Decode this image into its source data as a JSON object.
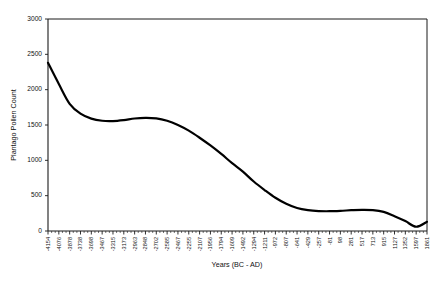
{
  "chart_data": {
    "type": "line",
    "title": "",
    "xlabel": "Years (BC - AD)",
    "ylabel": "Plantago Pollen Count",
    "ylim": [
      0,
      3000
    ],
    "ytick_labels": [
      "0",
      "500",
      "1000",
      "1500",
      "2000",
      "2500",
      "3000"
    ],
    "ytick_values": [
      0,
      500,
      1000,
      1500,
      2000,
      2500,
      3000
    ],
    "grid": false,
    "legend": "none",
    "categories": [
      "-4154",
      "-4076",
      "-3878",
      "-3738",
      "-3698",
      "-3467",
      "-3315",
      "-3173",
      "-2963",
      "-2848",
      "-2702",
      "-2585",
      "-2467",
      "-2255",
      "-2107",
      "-1956",
      "-1794",
      "-1609",
      "-1492",
      "-1294",
      "-1211",
      "-972",
      "-807",
      "-641",
      "-429",
      "-257",
      "-81",
      "98",
      "281",
      "517",
      "713",
      "915",
      "1127",
      "1352",
      "1597",
      "1861"
    ],
    "values": [
      2380,
      2080,
      1800,
      1660,
      1590,
      1560,
      1556,
      1570,
      1592,
      1600,
      1594,
      1560,
      1500,
      1420,
      1320,
      1210,
      1090,
      960,
      840,
      700,
      580,
      470,
      385,
      325,
      295,
      282,
      280,
      285,
      294,
      300,
      296,
      270,
      210,
      140,
      60,
      130
    ]
  }
}
